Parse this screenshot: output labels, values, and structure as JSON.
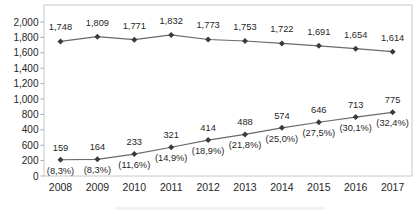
{
  "chart_data": {
    "type": "line",
    "title": "",
    "categories": [
      "2008",
      "2009",
      "2010",
      "2011",
      "2012",
      "2013",
      "2014",
      "2015",
      "2016",
      "2017"
    ],
    "series": [
      {
        "values": [
          1748,
          1809,
          1771,
          1832,
          1773,
          1753,
          1722,
          1691,
          1654,
          1614
        ],
        "labels": [
          "1,748",
          "1,809",
          "1,771",
          "1,832",
          "1,773",
          "1,753",
          "1,722",
          "1,691",
          "1,654",
          "1,614"
        ]
      },
      {
        "values": [
          159,
          164,
          233,
          321,
          414,
          488,
          574,
          646,
          713,
          775
        ],
        "labels": [
          "159",
          "164",
          "233",
          "321",
          "414",
          "488",
          "574",
          "646",
          "713",
          "775"
        ],
        "percent_labels": [
          "(8,3%)",
          "(8,3%)",
          "(11,6%)",
          "(14,9%)",
          "(18,9%)",
          "(21,8%)",
          "(25,0%)",
          "(27,5%)",
          "(30,1%)",
          "(32,4%)"
        ]
      }
    ],
    "y_axis": {
      "min": 0,
      "max": 2000,
      "step": 200,
      "tick_labels_top_to_bottom": [
        "2,000",
        "1,800",
        "1,600",
        "1,400",
        "1,200",
        "1,000",
        "800",
        "400",
        "600",
        "200",
        "0"
      ]
    },
    "grid": "off",
    "legend": "none",
    "colors": {
      "line": "#6a6a6a",
      "marker": "#3a3a3a",
      "data_label_text": "#1f1f1f",
      "axis_text": "#262626",
      "plot_border": "#c8c8c8",
      "tick": "#a8a8a8",
      "background": "#ffffff"
    }
  }
}
